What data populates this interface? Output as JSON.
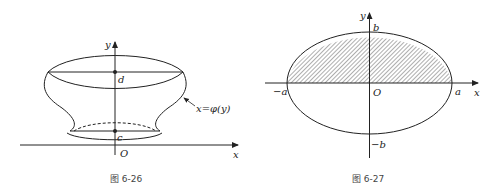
{
  "figures": [
    {
      "caption": "图 6-26",
      "labels": {
        "y_axis": "y",
        "x_axis": "x",
        "origin": "O",
        "top_point": "d",
        "bottom_point": "c",
        "curve": "x=φ(y)"
      }
    },
    {
      "caption": "图 6-27",
      "labels": {
        "y_axis": "y",
        "x_axis": "x",
        "origin": "O",
        "b_top": "b",
        "b_bottom": "−b",
        "a_left": "−a",
        "a_right": "a"
      }
    }
  ],
  "colors": {
    "stroke": "#222222",
    "background": "#ffffff"
  }
}
